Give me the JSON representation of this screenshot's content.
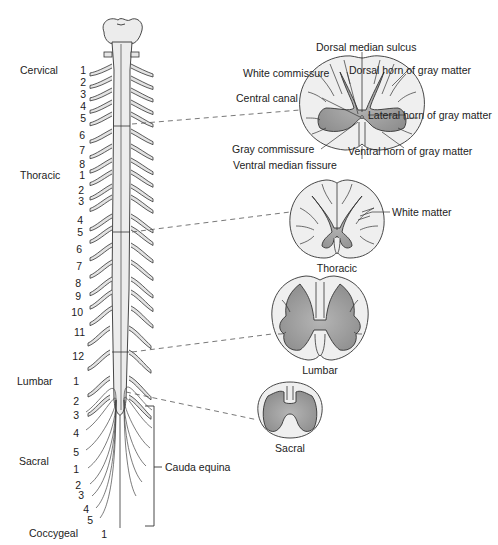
{
  "diagram": {
    "regions": [
      {
        "name": "Cervical",
        "numbers": [
          "1",
          "2",
          "3",
          "4",
          "5",
          "6",
          "7",
          "8"
        ]
      },
      {
        "name": "Thoracic",
        "numbers": [
          "1",
          "2",
          "3",
          "4",
          "5",
          "6",
          "7",
          "8",
          "9",
          "10",
          "11",
          "12"
        ]
      },
      {
        "name": "Lumbar",
        "numbers": [
          "1",
          "2",
          "3",
          "4",
          "5"
        ]
      },
      {
        "name": "Sacral",
        "numbers": [
          "1",
          "2",
          "3",
          "4",
          "5"
        ]
      },
      {
        "name": "Coccygeal",
        "numbers": [
          "1"
        ]
      }
    ],
    "region_labels": {
      "cervical": "Cervical",
      "thoracic": "Thoracic",
      "lumbar": "Lumbar",
      "sacral": "Sacral",
      "coccygeal": "Coccygeal"
    },
    "cauda_equina": "Cauda equina",
    "cross_sections": {
      "cervical": {
        "labels": {
          "dorsal_median_sulcus": "Dorsal median sulcus",
          "white_commissure": "White commissure",
          "dorsal_horn": "Dorsal horn of gray matter",
          "central_canal": "Central canal",
          "lateral_horn": "Lateral horn of gray matter",
          "gray_commissure": "Gray commissure",
          "ventral_horn": "Ventral horn of gray matter",
          "ventral_median_fissure": "Ventral median fissure"
        }
      },
      "thoracic": {
        "caption": "Thoracic",
        "labels": {
          "white_matter": "White matter"
        }
      },
      "lumbar": {
        "caption": "Lumbar"
      },
      "sacral": {
        "caption": "Sacral"
      }
    },
    "colors": {
      "white_matter": "#efefef",
      "gray_matter": "#9a9a9a",
      "outline": "#333333",
      "cord": "#eaeaea",
      "background": "#ffffff"
    }
  }
}
